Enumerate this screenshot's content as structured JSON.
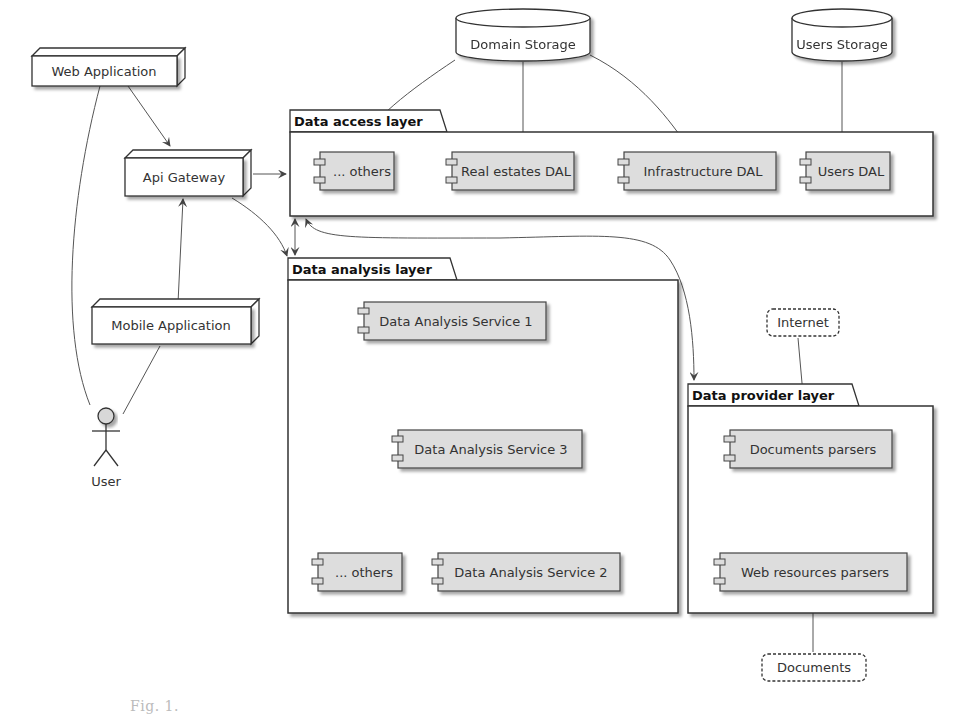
{
  "nodes": {
    "web_app": "Web Application",
    "api_gateway": "Api Gateway",
    "mobile_app": "Mobile Application",
    "user": "User"
  },
  "storages": {
    "domain": "Domain Storage",
    "users": "Users Storage"
  },
  "packages": {
    "data_access": {
      "title": "Data access layer",
      "components": [
        "... others",
        "Real estates DAL",
        "Infrastructure DAL",
        "Users DAL"
      ]
    },
    "data_analysis": {
      "title": "Data analysis layer",
      "components": [
        "Data Analysis Service 1",
        "Data Analysis Service 3",
        "... others",
        "Data Analysis Service 2"
      ]
    },
    "data_provider": {
      "title": "Data provider layer",
      "components": [
        "Documents parsers",
        "Web resources parsers"
      ]
    }
  },
  "clouds": {
    "internet": "Internet",
    "documents": "Documents"
  },
  "caption": "Fig. 1."
}
